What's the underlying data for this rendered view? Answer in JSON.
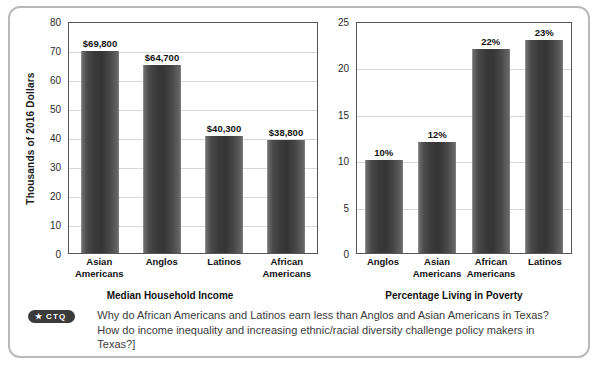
{
  "figure": {
    "background": "#ffffff",
    "border_color": "#b9b9b9"
  },
  "chart_data": [
    {
      "type": "bar",
      "title": "",
      "xlabel": "Median Household Income",
      "ylabel": "Thousands of 2016 Dollars",
      "categories": [
        "Asian\nAmericans",
        "Anglos",
        "Latinos",
        "African\nAmericans"
      ],
      "category_lines": [
        [
          "Asian",
          "Americans"
        ],
        [
          "Anglos"
        ],
        [
          "Latinos"
        ],
        [
          "African",
          "Americans"
        ]
      ],
      "values": [
        69.8,
        64.7,
        40.3,
        38.8
      ],
      "data_labels": [
        "$69,800",
        "$64,700",
        "$40,300",
        "$38,800"
      ],
      "ylim": [
        0,
        80
      ],
      "yticks": [
        80,
        70,
        60,
        50,
        40,
        30,
        20,
        10,
        0
      ],
      "grid": true,
      "legend": "none",
      "bar_color": "#3a3a3a"
    },
    {
      "type": "bar",
      "title": "",
      "xlabel": "Percentage Living in Poverty",
      "ylabel": "",
      "categories": [
        "Anglos",
        "Asian\nAmericans",
        "African\nAmericans",
        "Latinos"
      ],
      "category_lines": [
        [
          "Anglos"
        ],
        [
          "Asian",
          "Americans"
        ],
        [
          "African",
          "Americans"
        ],
        [
          "Latinos"
        ]
      ],
      "values": [
        10,
        12,
        22,
        23
      ],
      "data_labels": [
        "10%",
        "12%",
        "22%",
        "23%"
      ],
      "ylim": [
        0,
        25
      ],
      "yticks": [
        25,
        20,
        15,
        10,
        5,
        0
      ],
      "grid": true,
      "legend": "none",
      "bar_color": "#3a3a3a"
    }
  ],
  "ctq": {
    "badge_star": "★",
    "badge_label": "CTQ",
    "question": "Why do African Americans and Latinos earn less than Anglos and Asian Americans in Texas? How do income inequality and increasing ethnic/racial diversity challenge policy makers in Texas?]"
  }
}
